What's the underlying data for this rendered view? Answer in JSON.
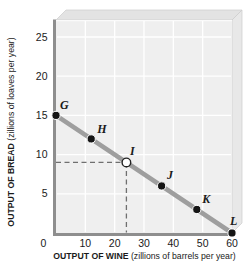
{
  "figure": {
    "colors": {
      "background": "#ffffff",
      "plot_face": "#efefef",
      "top_face": "#e3e3e3",
      "right_face": "#e8e8e8",
      "edge": "#cccccc",
      "edge_highlight": "#fafafa",
      "grid": "#ffffff",
      "axis": "#8e8e8e",
      "ppf_line": "#9e9e9e",
      "dash": "#6f6f6f",
      "point_fill": "#151515",
      "point_ring": "#ffffff",
      "open_point_fill": "#ffffff",
      "open_point_stroke": "#222222",
      "text": "#1a1a1a"
    }
  },
  "chart_data": {
    "type": "line",
    "title": "",
    "xlabel": "OUTPUT OF WINE",
    "xlabel_units": " (zillions of barrels per year)",
    "ylabel": "OUTPUT OF BREAD",
    "ylabel_units": " (zillions of loaves per year)",
    "xlim": [
      0,
      60
    ],
    "ylim": [
      0,
      25
    ],
    "x_ticks": [
      0,
      10,
      20,
      30,
      40,
      50,
      60
    ],
    "y_ticks": [
      5,
      10,
      15,
      20,
      25
    ],
    "grid": true,
    "legend": false,
    "series": [
      {
        "name": "production-possibilities-frontier",
        "points": [
          {
            "label": "G",
            "x": 0,
            "y": 15,
            "style": "filled",
            "label_dx": 4,
            "label_dy": -6.5
          },
          {
            "label": "H",
            "x": 12,
            "y": 12,
            "style": "filled",
            "label_dx": 6,
            "label_dy": -6
          },
          {
            "label": "I",
            "x": 24,
            "y": 9,
            "style": "open",
            "guides": true,
            "label_dx": 3.5,
            "label_dy": -7
          },
          {
            "label": "J",
            "x": 36,
            "y": 6,
            "style": "filled",
            "label_dx": 5.5,
            "label_dy": -6.5
          },
          {
            "label": "K",
            "x": 48,
            "y": 3,
            "style": "filled",
            "label_dx": 5.5,
            "label_dy": -6.5
          },
          {
            "label": "L",
            "x": 60,
            "y": 0,
            "style": "filled",
            "label_dx": -2,
            "label_dy": -8.5
          }
        ]
      }
    ]
  }
}
